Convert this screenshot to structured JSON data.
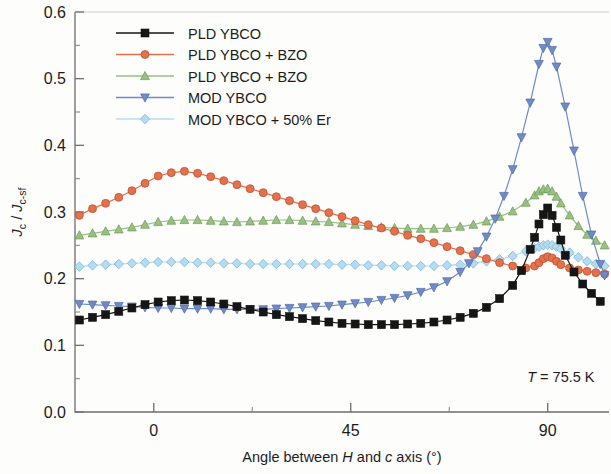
{
  "chart_data": {
    "type": "line",
    "title": "",
    "xlabel": "Angle between H and c axis (°)",
    "ylabel": "Jc / Jc-sf",
    "xlim": [
      -18,
      104
    ],
    "ylim": [
      0.0,
      0.6
    ],
    "xticks": [
      0,
      45,
      90
    ],
    "xtick_labels": [
      "0",
      "45",
      "90"
    ],
    "xminorticks": [
      -18,
      22.5,
      67.5,
      104
    ],
    "yticks": [
      0.0,
      0.1,
      0.2,
      0.3,
      0.4,
      0.5,
      0.6
    ],
    "ytick_labels": [
      "0.0",
      "0.1",
      "0.2",
      "0.3",
      "0.4",
      "0.5",
      "0.6"
    ],
    "yminorticks": [
      0.05,
      0.15,
      0.25,
      0.35,
      0.45,
      0.55
    ],
    "grid": false,
    "legend_position": "top-left",
    "annotations": [
      {
        "text": "T = 75.5 K",
        "x": 93,
        "y": 0.045,
        "italic_prefix": "T"
      }
    ],
    "series": [
      {
        "name": "PLD YBCO",
        "color": "#161616",
        "marker": "square",
        "x": [
          -17,
          -14,
          -11,
          -8,
          -5,
          -2,
          1,
          4,
          7,
          10,
          13,
          16,
          19,
          22,
          25,
          28,
          31,
          34,
          37,
          40,
          43,
          46,
          49,
          52,
          55,
          58,
          61,
          64,
          67,
          70,
          73,
          76,
          79,
          82,
          84,
          86,
          87,
          88,
          89,
          90,
          91,
          92,
          93,
          94,
          96,
          98,
          100,
          102
        ],
        "y": [
          0.138,
          0.142,
          0.146,
          0.151,
          0.156,
          0.161,
          0.165,
          0.167,
          0.168,
          0.167,
          0.165,
          0.162,
          0.158,
          0.154,
          0.15,
          0.146,
          0.143,
          0.14,
          0.137,
          0.135,
          0.133,
          0.132,
          0.131,
          0.131,
          0.131,
          0.132,
          0.133,
          0.135,
          0.138,
          0.142,
          0.148,
          0.157,
          0.17,
          0.19,
          0.212,
          0.244,
          0.262,
          0.282,
          0.296,
          0.306,
          0.295,
          0.277,
          0.258,
          0.235,
          0.21,
          0.192,
          0.178,
          0.166
        ]
      },
      {
        "name": "PLD YBCO + BZO",
        "color": "#e4704c",
        "marker": "circle",
        "x": [
          -17,
          -14,
          -11,
          -8,
          -5,
          -2,
          1,
          4,
          7,
          10,
          13,
          16,
          19,
          22,
          25,
          28,
          31,
          34,
          37,
          40,
          43,
          46,
          49,
          52,
          55,
          58,
          61,
          64,
          67,
          70,
          73,
          76,
          79,
          82,
          85,
          87,
          88,
          89,
          90,
          91,
          92,
          93,
          95,
          97,
          99,
          101,
          103
        ],
        "y": [
          0.295,
          0.305,
          0.313,
          0.322,
          0.332,
          0.343,
          0.354,
          0.359,
          0.361,
          0.358,
          0.353,
          0.347,
          0.341,
          0.335,
          0.329,
          0.323,
          0.317,
          0.311,
          0.305,
          0.299,
          0.293,
          0.287,
          0.281,
          0.276,
          0.271,
          0.265,
          0.26,
          0.254,
          0.248,
          0.242,
          0.236,
          0.23,
          0.224,
          0.219,
          0.216,
          0.219,
          0.224,
          0.23,
          0.233,
          0.231,
          0.226,
          0.221,
          0.216,
          0.213,
          0.211,
          0.209,
          0.207
        ]
      },
      {
        "name": "PLD YBCO + BZO",
        "color": "#97c082",
        "marker": "triangle-up",
        "x": [
          -17,
          -14,
          -11,
          -8,
          -5,
          -2,
          1,
          4,
          7,
          10,
          13,
          16,
          19,
          22,
          25,
          28,
          31,
          34,
          37,
          40,
          43,
          46,
          49,
          52,
          55,
          58,
          61,
          64,
          67,
          70,
          73,
          76,
          79,
          82,
          85,
          87,
          88,
          89,
          90,
          91,
          92,
          93,
          95,
          97,
          99,
          101,
          103
        ],
        "y": [
          0.265,
          0.268,
          0.271,
          0.274,
          0.277,
          0.281,
          0.285,
          0.287,
          0.288,
          0.288,
          0.287,
          0.286,
          0.285,
          0.286,
          0.287,
          0.288,
          0.288,
          0.287,
          0.286,
          0.285,
          0.283,
          0.281,
          0.279,
          0.277,
          0.276,
          0.275,
          0.275,
          0.275,
          0.276,
          0.278,
          0.281,
          0.286,
          0.293,
          0.301,
          0.314,
          0.325,
          0.331,
          0.334,
          0.335,
          0.331,
          0.323,
          0.313,
          0.295,
          0.279,
          0.266,
          0.257,
          0.25
        ]
      },
      {
        "name": "MOD YBCO",
        "color": "#6f8bc6",
        "marker": "triangle-down",
        "x": [
          -17,
          -14,
          -11,
          -8,
          -5,
          -2,
          1,
          4,
          7,
          10,
          13,
          16,
          19,
          22,
          25,
          28,
          31,
          34,
          37,
          40,
          43,
          46,
          49,
          52,
          55,
          58,
          61,
          64,
          67,
          70,
          72,
          74,
          76,
          78,
          80,
          82,
          84,
          86,
          88,
          89,
          90,
          91,
          92,
          94,
          96,
          98,
          100,
          102,
          103
        ],
        "y": [
          0.162,
          0.161,
          0.16,
          0.159,
          0.158,
          0.157,
          0.156,
          0.156,
          0.155,
          0.155,
          0.155,
          0.154,
          0.154,
          0.154,
          0.154,
          0.155,
          0.156,
          0.157,
          0.158,
          0.159,
          0.161,
          0.163,
          0.165,
          0.168,
          0.171,
          0.175,
          0.18,
          0.187,
          0.196,
          0.21,
          0.223,
          0.241,
          0.263,
          0.29,
          0.324,
          0.364,
          0.412,
          0.464,
          0.522,
          0.546,
          0.555,
          0.543,
          0.518,
          0.458,
          0.392,
          0.324,
          0.266,
          0.222,
          0.205
        ]
      },
      {
        "name": "MOD YBCO + 50% Er",
        "color": "#b4dcf0",
        "marker": "diamond",
        "x": [
          -17,
          -14,
          -11,
          -8,
          -5,
          -2,
          1,
          4,
          7,
          10,
          13,
          16,
          19,
          22,
          25,
          28,
          31,
          34,
          37,
          40,
          43,
          46,
          49,
          52,
          55,
          58,
          61,
          64,
          67,
          70,
          73,
          76,
          79,
          82,
          85,
          87,
          88,
          89,
          90,
          91,
          92,
          93,
          95,
          97,
          99,
          101,
          103
        ],
        "y": [
          0.218,
          0.22,
          0.221,
          0.222,
          0.223,
          0.224,
          0.225,
          0.225,
          0.225,
          0.224,
          0.224,
          0.223,
          0.223,
          0.222,
          0.222,
          0.222,
          0.222,
          0.222,
          0.222,
          0.222,
          0.221,
          0.221,
          0.22,
          0.22,
          0.219,
          0.219,
          0.219,
          0.219,
          0.22,
          0.221,
          0.223,
          0.226,
          0.229,
          0.234,
          0.241,
          0.246,
          0.248,
          0.25,
          0.251,
          0.25,
          0.248,
          0.245,
          0.239,
          0.232,
          0.226,
          0.222,
          0.219
        ]
      }
    ]
  },
  "legend": {
    "items": [
      {
        "label": "PLD YBCO"
      },
      {
        "label": "PLD YBCO + BZO"
      },
      {
        "label": "PLD YBCO + BZO"
      },
      {
        "label": "MOD YBCO"
      },
      {
        "label": "MOD YBCO + 50% Er"
      }
    ]
  },
  "axes": {
    "x_title_parts": [
      "Angle between ",
      "H",
      " and ",
      "c",
      " axis (°)"
    ],
    "y_title": "Jc / Jc-sf"
  }
}
